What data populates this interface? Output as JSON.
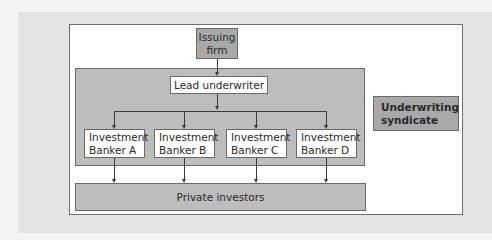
{
  "diagram": {
    "type": "flowchart",
    "nodes": {
      "issuing_firm": "Issuing firm",
      "lead_underwriter": "Lead underwriter",
      "bankers": [
        {
          "line1": "Investment",
          "line2": "Banker A"
        },
        {
          "line1": "Investment",
          "line2": "Banker B"
        },
        {
          "line1": "Investment",
          "line2": "Banker C"
        },
        {
          "line1": "Investment",
          "line2": "Banker D"
        }
      ],
      "private_investors": "Private investors"
    },
    "group_label": {
      "line1": "Underwriting",
      "line2": "syndicate"
    },
    "edges": [
      {
        "from": "Issuing firm",
        "to": "Lead underwriter"
      },
      {
        "from": "Lead underwriter",
        "to": "Investment Banker A"
      },
      {
        "from": "Lead underwriter",
        "to": "Investment Banker B"
      },
      {
        "from": "Lead underwriter",
        "to": "Investment Banker C"
      },
      {
        "from": "Lead underwriter",
        "to": "Investment Banker D"
      },
      {
        "from": "Investment Banker A",
        "to": "Private investors"
      },
      {
        "from": "Investment Banker B",
        "to": "Private investors"
      },
      {
        "from": "Investment Banker C",
        "to": "Private investors"
      },
      {
        "from": "Investment Banker D",
        "to": "Private investors"
      }
    ],
    "colors": {
      "panel": "#e4e4e4",
      "frame": "#ffffff",
      "dark_box": "#a9a9a9",
      "mid_box": "#bdbdbd",
      "line": "#3a3a3a"
    }
  }
}
